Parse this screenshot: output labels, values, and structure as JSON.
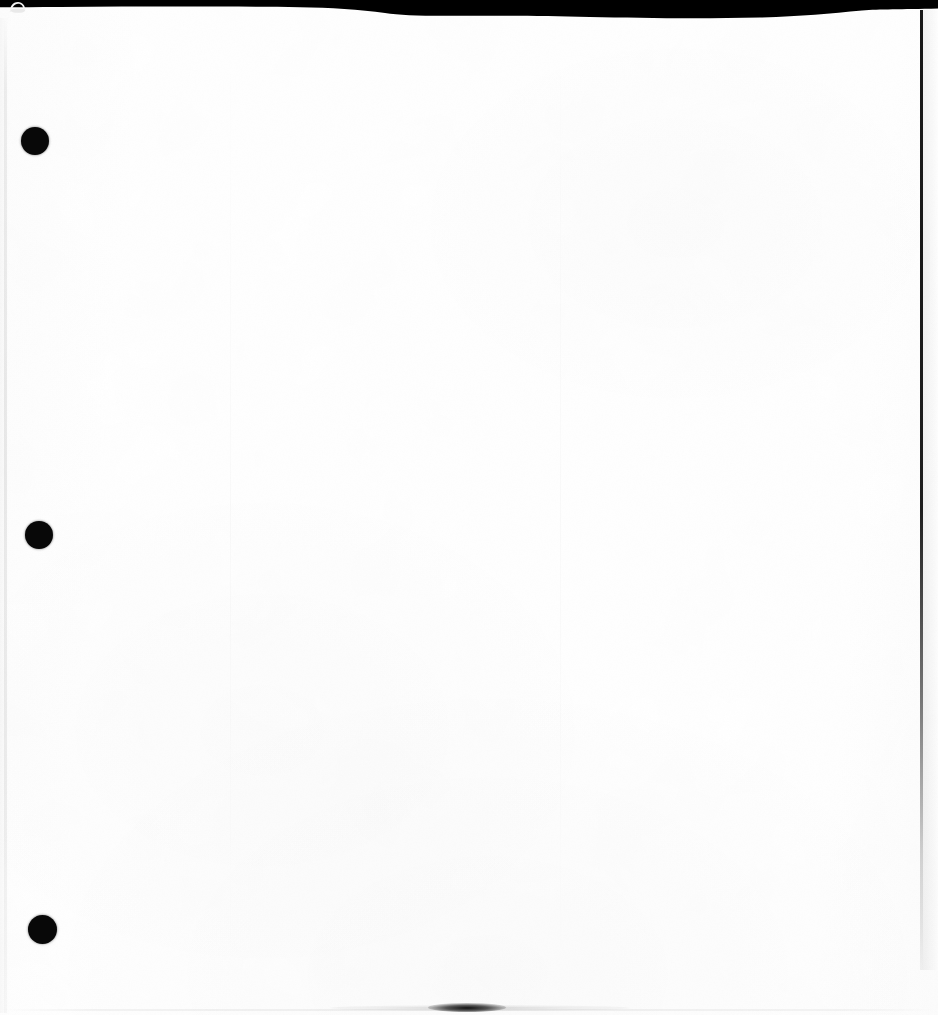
{
  "document": {
    "kind": "scanned-page",
    "content_text": "",
    "page_state": "blank",
    "width": 938,
    "height": 1015
  },
  "colors": {
    "paper": "#ffffff",
    "scanner_background": "#000000",
    "hole_punch": "#080808",
    "edge_line": "#0a0a0a",
    "grain": "#fafafa"
  },
  "artifacts": {
    "scanner_band": {
      "name": "scanner-band",
      "position": "top",
      "max_height_px": 15,
      "edge_height_px": 7
    },
    "corner_curl": {
      "name": "corner-curl",
      "x": 8,
      "y": 0,
      "width": 20,
      "height": 13
    },
    "hole_punches": [
      {
        "label": "hole-1",
        "cx": 35,
        "cy": 141,
        "r": 14
      },
      {
        "label": "hole-2",
        "cx": 39,
        "cy": 535,
        "r": 14
      },
      {
        "label": "hole-3",
        "cx": 43,
        "cy": 930,
        "r": 14.5
      }
    ],
    "edges": {
      "left_line_x": 5,
      "right_line_x": 921,
      "bottom_line_y": 1011
    },
    "bottom_smudge": {
      "label": "bottom-smudge",
      "cx": 467,
      "cy": 1007,
      "width": 78,
      "height": 9
    }
  }
}
